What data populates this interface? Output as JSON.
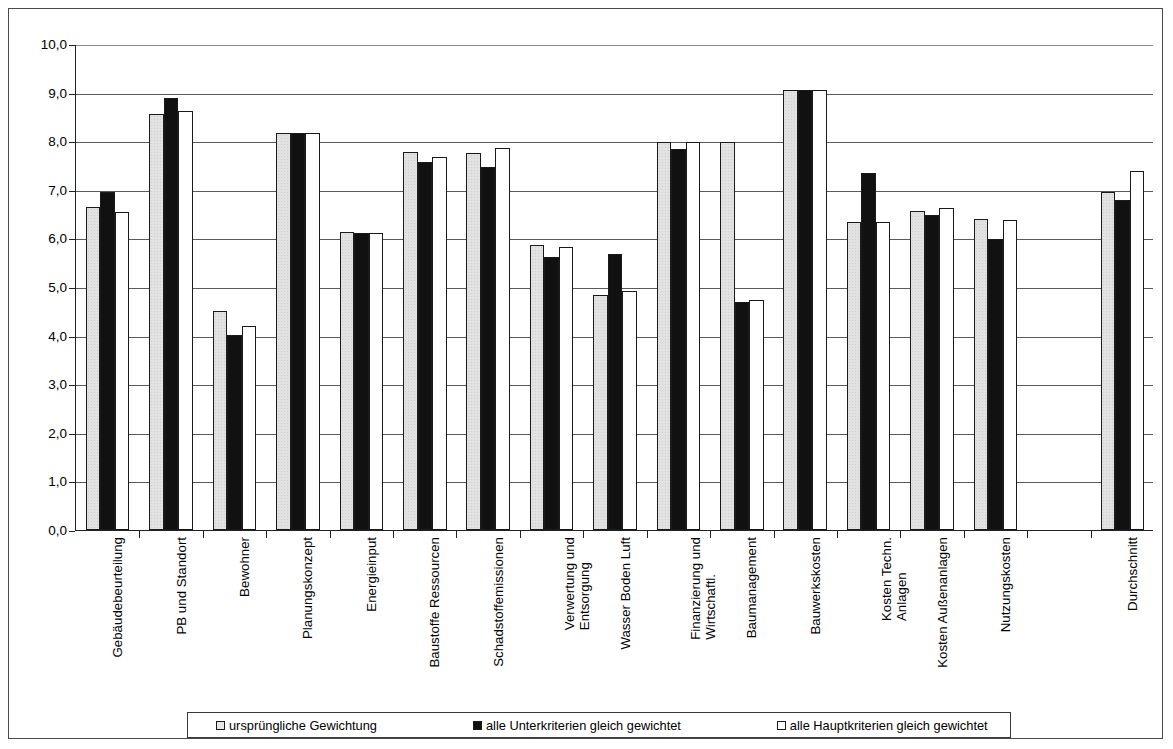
{
  "chart_data": {
    "type": "bar",
    "title": "",
    "subtitle": "",
    "xlabel": "",
    "ylabel": "",
    "ylim": [
      0.0,
      10.0
    ],
    "grid": true,
    "legend_position": "bottom",
    "ytick_labels": [
      "10,0",
      "9,0",
      "8,0",
      "7,0",
      "6,0",
      "5,0",
      "4,0",
      "3,0",
      "2,0",
      "1,0",
      "0,0"
    ],
    "ytick_values": [
      10.0,
      9.0,
      8.0,
      7.0,
      6.0,
      5.0,
      4.0,
      3.0,
      2.0,
      1.0,
      0.0
    ],
    "categories": [
      "Gebäudebeurteilung",
      "PB und Standort",
      "Bewohner",
      "Planungskonzept",
      "Energieinput",
      "Baustoffe Ressourcen",
      "Schadstoffemissionen",
      "Verwertung und Entsorgung",
      "Wasser Boden Luft",
      "Finanzierung und Wirtschaftl.",
      "Baumanagement",
      "Bauwerkskosten",
      "Kosten Techn. Anlagen",
      "Kosten Außenanlagen",
      "Nutzungskosten",
      "",
      "Durchschnitt"
    ],
    "category_lines": [
      [
        "Gebäudebeurteilung"
      ],
      [
        "PB und Standort"
      ],
      [
        "Bewohner"
      ],
      [
        "Planungskonzept"
      ],
      [
        "Energieinput"
      ],
      [
        "Baustoffe Ressourcen"
      ],
      [
        "Schadstoffemissionen"
      ],
      [
        "Verwertung und",
        "Entsorgung"
      ],
      [
        "Wasser Boden Luft"
      ],
      [
        "Finanzierung und",
        "Wirtschaftl."
      ],
      [
        "Baumanagement"
      ],
      [
        "Bauwerkskosten"
      ],
      [
        "Kosten Techn.",
        "Anlagen"
      ],
      [
        "Kosten Außenanlagen"
      ],
      [
        "Nutzungskosten"
      ],
      [
        ""
      ],
      [
        "Durchschnitt"
      ]
    ],
    "series": [
      {
        "name": "ursprüngliche Gewichtung",
        "color": "#e2e2e2",
        "values": [
          6.65,
          8.55,
          4.5,
          8.16,
          6.14,
          7.77,
          7.76,
          5.87,
          4.83,
          7.99,
          7.99,
          9.05,
          6.33,
          6.57,
          6.39,
          null,
          6.96
        ]
      },
      {
        "name": "alle Unterkriterien gleich gewichtet",
        "color": "#111111",
        "values": [
          6.96,
          8.88,
          4.01,
          8.16,
          6.11,
          7.58,
          7.46,
          5.61,
          5.68,
          7.85,
          4.7,
          9.05,
          7.35,
          6.48,
          5.99,
          null,
          6.8
        ]
      },
      {
        "name": "alle Hauptkriterien gleich gewichtet",
        "color": "#ffffff",
        "values": [
          6.55,
          8.62,
          4.2,
          8.16,
          6.11,
          7.68,
          7.87,
          5.83,
          4.92,
          7.99,
          4.73,
          9.05,
          6.33,
          6.62,
          6.38,
          null,
          7.39
        ]
      }
    ]
  },
  "legend": {
    "items": [
      {
        "label": "ursprüngliche Gewichtung",
        "swatch": "light-grey-square"
      },
      {
        "label": "alle Unterkriterien gleich gewichtet",
        "swatch": "black-square"
      },
      {
        "label": "alle Hauptkriterien gleich gewichtet",
        "swatch": "white-square"
      }
    ]
  }
}
